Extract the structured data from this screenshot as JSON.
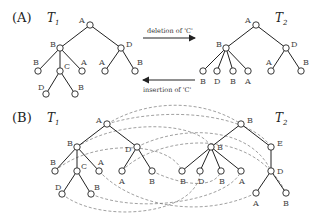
{
  "panel_a": {
    "label": "(A)",
    "tree1": {
      "title": "T",
      "sub": "1"
    },
    "tree2": {
      "title": "T",
      "sub": "2"
    },
    "arrow_forward": "deletion of 'C'",
    "arrow_backward": "insertion of 'C'",
    "t1_labels": {
      "root": "A",
      "b": "B",
      "d": "D",
      "b_leaf": "B",
      "c": "C",
      "a_leaf": "A",
      "da": "A",
      "db": "B",
      "cd": "D",
      "cb": "B"
    },
    "t2_labels": {
      "root": "A",
      "b": "B",
      "d": "D",
      "l1": "B",
      "l2": "D",
      "l3": "B",
      "l4": "A",
      "da": "A",
      "db": "B"
    }
  },
  "panel_b": {
    "label": "(B)",
    "tree1": {
      "title": "T",
      "sub": "1"
    },
    "tree2": {
      "title": "T",
      "sub": "2"
    },
    "t1_labels": {
      "root": "A",
      "b": "B",
      "d": "D",
      "b_leaf": "B",
      "c": "C",
      "a_leaf": "A",
      "da": "A",
      "db": "B",
      "cd": "D",
      "cb": "B"
    },
    "t2_labels": {
      "root": "B",
      "b": "B",
      "e": "E",
      "l1": "B",
      "l2": "D",
      "l3": "B",
      "l4": "A",
      "d": "D",
      "da": "A",
      "db": "B"
    }
  }
}
